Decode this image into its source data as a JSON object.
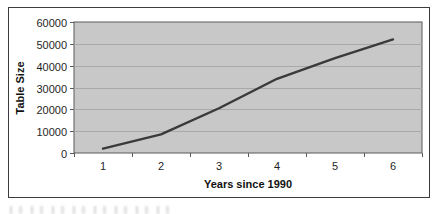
{
  "figure": {
    "y_axis_title": "Table Size",
    "x_axis_title": "Years since 1990"
  },
  "chart_data": {
    "type": "line",
    "title": "",
    "xlabel": "Years since 1990",
    "ylabel": "Table Size",
    "categories": [
      "1",
      "2",
      "3",
      "4",
      "5",
      "6"
    ],
    "values": [
      2000,
      8500,
      20500,
      34000,
      43500,
      52000
    ],
    "ylim": [
      0,
      60000
    ],
    "ytick_interval": 10000,
    "ytick_labels": [
      "0",
      "10000",
      "20000",
      "30000",
      "40000",
      "50000",
      "60000"
    ],
    "grid": true,
    "legend_position": "none",
    "colors": {
      "plot_area_fill": "#c8c8c8",
      "gridline": "#a9a9a9",
      "series_line": "#3a3a3a",
      "axis_line": "#5a5a5a",
      "frame_border": "#3c3c3c",
      "axis_text": "#1f1f1f",
      "chart_background": "#ffffff"
    }
  }
}
